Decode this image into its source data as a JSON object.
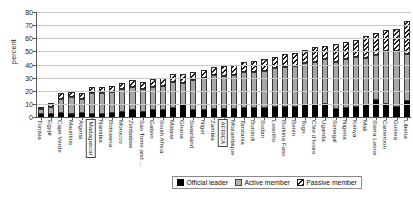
{
  "chart_data": {
    "type": "bar",
    "subtype": "stacked-bar",
    "title": "",
    "xlabel": "",
    "ylabel": "percent",
    "ylim": [
      0,
      80
    ],
    "yticks": [
      0,
      10,
      20,
      30,
      40,
      50,
      60,
      70,
      80
    ],
    "grid": true,
    "legend_position": "bottom",
    "highlighted_categories": [
      "Madagascar",
      "AFRICA"
    ],
    "categories": [
      "Tunisia",
      "Egypt",
      "Cape Verde",
      "Mauritius",
      "Algeria",
      "Madagascar",
      "Namibia",
      "Botswana",
      "Morocco",
      "Zimbabwe",
      "Sao Tome and ...",
      "Gabon",
      "South Africa",
      "Malawi",
      "Ghana",
      "Swaziland",
      "Niger",
      "Zambia",
      "AFRICA",
      "Mozambique",
      "Tanzania",
      "Burundi",
      "Sudan",
      "Lesotho",
      "Burkina Faso",
      "Benin",
      "Togo",
      "Côte d'Ivoire",
      "Uganda",
      "Senegal",
      "Nigeria",
      "Kenya",
      "Mali",
      "Sierra Leone",
      "Cameroon",
      "Guinea",
      "Liberia"
    ],
    "series": [
      {
        "name": "Official leader",
        "color": "#000000",
        "values": [
          2,
          2,
          3,
          2,
          3,
          2,
          2,
          3,
          4,
          5,
          4,
          5,
          5,
          7,
          9,
          5,
          5,
          6,
          6,
          6,
          7,
          7,
          7,
          8,
          8,
          8,
          9,
          9,
          10,
          6,
          7,
          8,
          9,
          13,
          10,
          8,
          12
        ]
      },
      {
        "name": "Active member",
        "color": "#a8a8a8",
        "values": [
          4,
          6,
          11,
          13,
          11,
          16,
          16,
          16,
          17,
          18,
          17,
          18,
          19,
          20,
          17,
          23,
          25,
          26,
          25,
          26,
          27,
          27,
          28,
          29,
          30,
          31,
          32,
          33,
          34,
          36,
          37,
          38,
          36,
          34,
          40,
          42,
          36
        ]
      },
      {
        "name": "Passive member",
        "color": "#ffffff",
        "hatch": "diagonal",
        "values": [
          2,
          3,
          4,
          4,
          4,
          5,
          5,
          5,
          5,
          5,
          6,
          6,
          6,
          6,
          7,
          6,
          6,
          6,
          8,
          8,
          8,
          9,
          9,
          9,
          10,
          10,
          10,
          11,
          10,
          14,
          13,
          13,
          17,
          17,
          16,
          17,
          25
        ]
      }
    ]
  },
  "legend": {
    "items": [
      {
        "label": "Official leader"
      },
      {
        "label": "Active member"
      },
      {
        "label": "Passive member"
      }
    ]
  }
}
